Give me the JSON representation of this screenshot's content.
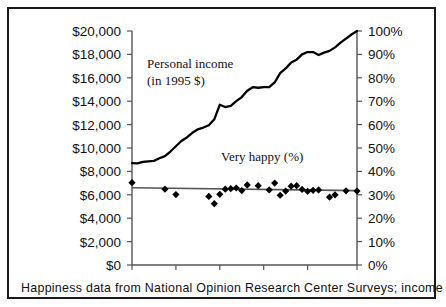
{
  "figure": {
    "caption": "Happiness data from National Opinion Research Center Surveys; income",
    "annotations": {
      "income_label_line1": "Personal income",
      "income_label_line2": "(in 1995 $)",
      "happy_label": "Very happy (%)"
    }
  },
  "chart_data": {
    "type": "line",
    "title": "",
    "xlabel": "",
    "ylabel": "",
    "grid": false,
    "legend": "inline-annotations",
    "xlim": [
      1957,
      1998
    ],
    "xticks": [
      "1957",
      "1965",
      "1973",
      "1981",
      "1989",
      "1998"
    ],
    "xtick_values": [
      1957,
      1965,
      1973,
      1981,
      1989,
      1998
    ],
    "axes": [
      {
        "id": "left",
        "name": "Personal income (in 1995 $)",
        "ylim": [
          0,
          20000
        ],
        "ytick_values": [
          0,
          2000,
          4000,
          6000,
          8000,
          10000,
          12000,
          14000,
          16000,
          18000,
          20000
        ],
        "yticks": [
          "$0",
          "$2,000",
          "$4,000",
          "$6,000",
          "$8,000",
          "$10,000",
          "$12,000",
          "$14,000",
          "$16,000",
          "$18,000",
          "$20,000"
        ]
      },
      {
        "id": "right",
        "name": "Very happy (%)",
        "ylim": [
          0,
          100
        ],
        "ytick_values": [
          0,
          10,
          20,
          30,
          40,
          50,
          60,
          70,
          80,
          90,
          100
        ],
        "yticks": [
          "0%",
          "10%",
          "20%",
          "30%",
          "40%",
          "50%",
          "60%",
          "70%",
          "80%",
          "90%",
          "100%"
        ]
      }
    ],
    "series": [
      {
        "name": "Personal income (in 1995 $)",
        "type": "line",
        "axis": "left",
        "color": "#000000",
        "x": [
          1957,
          1958,
          1959,
          1960,
          1961,
          1962,
          1963,
          1964,
          1965,
          1966,
          1967,
          1968,
          1969,
          1970,
          1971,
          1972,
          1973,
          1974,
          1975,
          1976,
          1977,
          1978,
          1979,
          1980,
          1981,
          1982,
          1983,
          1984,
          1985,
          1986,
          1987,
          1988,
          1989,
          1990,
          1991,
          1992,
          1993,
          1994,
          1995,
          1996,
          1997,
          1998
        ],
        "values": [
          8700,
          8680,
          8820,
          8860,
          8900,
          9120,
          9300,
          9700,
          10150,
          10600,
          10900,
          11300,
          11600,
          11750,
          11950,
          12450,
          13700,
          13500,
          13600,
          14000,
          14350,
          14900,
          15200,
          15150,
          15200,
          15200,
          15600,
          16400,
          16800,
          17300,
          17550,
          18000,
          18200,
          18200,
          17950,
          18150,
          18300,
          18600,
          19000,
          19350,
          19700,
          20000
        ]
      },
      {
        "name": "Very happy (%)",
        "type": "scatter",
        "axis": "right",
        "color": "#000000",
        "marker": "diamond",
        "x": [
          1957,
          1963,
          1965,
          1971,
          1972,
          1973,
          1974,
          1975,
          1976,
          1977,
          1978,
          1980,
          1982,
          1983,
          1984,
          1985,
          1986,
          1987,
          1988,
          1989,
          1990,
          1991,
          1993,
          1994,
          1996,
          1998
        ],
        "values": [
          35.2,
          32.4,
          30.1,
          29.3,
          26.2,
          30.2,
          32.4,
          32.6,
          32.9,
          31.8,
          34.2,
          33.9,
          32.1,
          35.0,
          29.8,
          31.6,
          33.7,
          33.9,
          32.3,
          31.5,
          31.9,
          32.1,
          29.0,
          30.0,
          31.7,
          31.6
        ]
      },
      {
        "name": "Very happy trend",
        "type": "line",
        "axis": "right",
        "color": "#555555",
        "x": [
          1957,
          1998
        ],
        "values": [
          33.0,
          31.8
        ]
      }
    ]
  }
}
